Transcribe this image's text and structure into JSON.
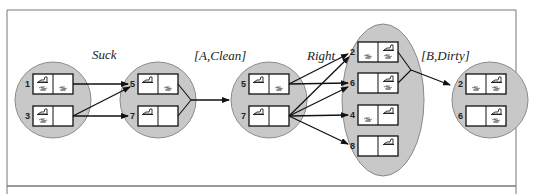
{
  "colors": {
    "blob_fill": "#c8c8c8",
    "blob_stroke": "#8a8a8a",
    "cell_fill": "#ffffff",
    "line": "#111111",
    "frame": "#777777"
  },
  "labels": {
    "suck": "Suck",
    "a_clean": "[A,Clean]",
    "right": "Right",
    "b_dirty": "[B,Dirty]"
  },
  "belief_states": [
    {
      "id": "b1",
      "states": [
        {
          "num": "1",
          "left_robot": true,
          "left_dirt": true,
          "right_robot": false,
          "right_dirt": true
        },
        {
          "num": "3",
          "left_robot": true,
          "left_dirt": true,
          "right_robot": false,
          "right_dirt": false
        }
      ]
    },
    {
      "id": "b2",
      "states": [
        {
          "num": "5",
          "left_robot": true,
          "left_dirt": false,
          "right_robot": false,
          "right_dirt": true
        },
        {
          "num": "7",
          "left_robot": true,
          "left_dirt": false,
          "right_robot": false,
          "right_dirt": false
        }
      ]
    },
    {
      "id": "b3",
      "states": [
        {
          "num": "5",
          "left_robot": true,
          "left_dirt": false,
          "right_robot": false,
          "right_dirt": true
        },
        {
          "num": "7",
          "left_robot": true,
          "left_dirt": false,
          "right_robot": false,
          "right_dirt": false
        }
      ]
    },
    {
      "id": "b4",
      "states": [
        {
          "num": "2",
          "left_robot": false,
          "left_dirt": true,
          "right_robot": true,
          "right_dirt": true
        },
        {
          "num": "6",
          "left_robot": false,
          "left_dirt": false,
          "right_robot": true,
          "right_dirt": true
        },
        {
          "num": "4",
          "left_robot": false,
          "left_dirt": true,
          "right_robot": true,
          "right_dirt": false
        },
        {
          "num": "8",
          "left_robot": false,
          "left_dirt": false,
          "right_robot": true,
          "right_dirt": false
        }
      ]
    },
    {
      "id": "b5",
      "states": [
        {
          "num": "2",
          "left_robot": false,
          "left_dirt": true,
          "right_robot": true,
          "right_dirt": true
        },
        {
          "num": "6",
          "left_robot": false,
          "left_dirt": false,
          "right_robot": true,
          "right_dirt": true
        }
      ]
    }
  ]
}
